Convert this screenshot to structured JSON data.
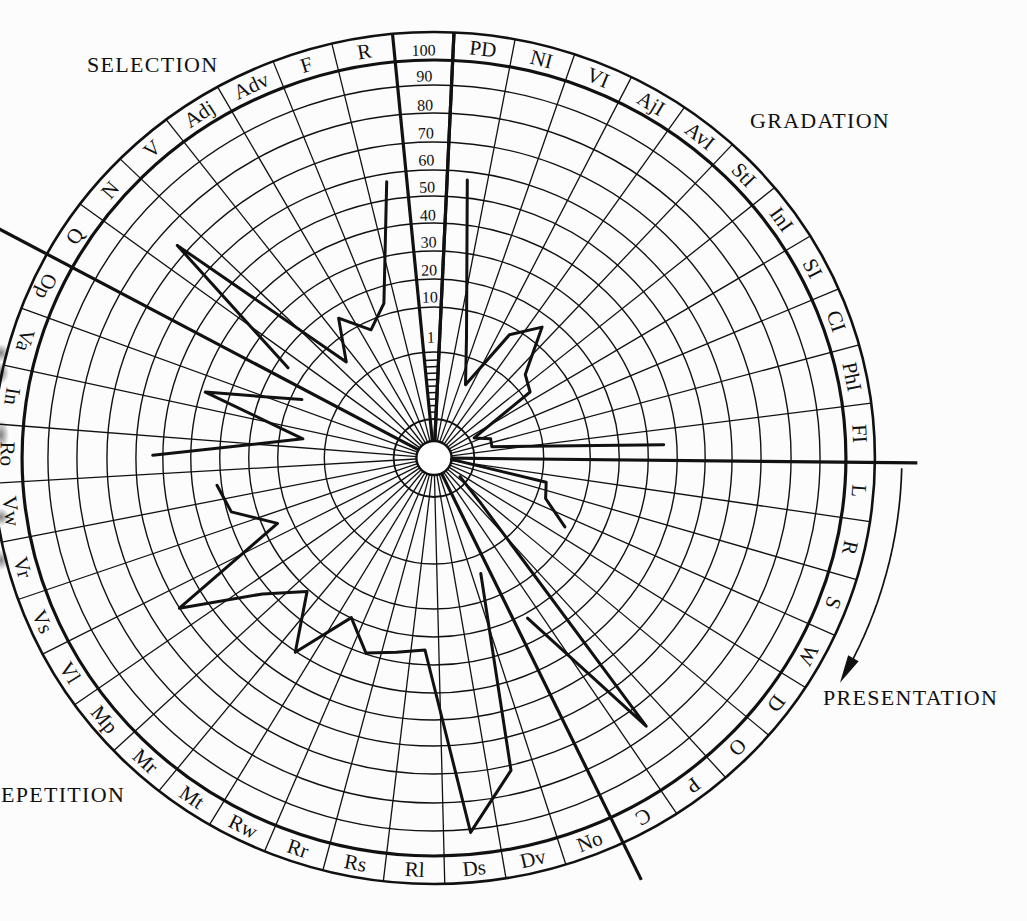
{
  "page": {
    "background": "#fcfcfc",
    "ink": "#111111"
  },
  "chart_data": {
    "type": "line",
    "coordinate_system": "polar",
    "title": "",
    "radial_axis": {
      "labels": [
        "100",
        "90",
        "80",
        "70",
        "60",
        "50",
        "40",
        "30",
        "20",
        "10",
        "1"
      ],
      "ticks": [
        100,
        90,
        80,
        70,
        60,
        50,
        40,
        30,
        20,
        10,
        1
      ],
      "range": [
        0,
        100
      ],
      "grid": true
    },
    "sections": [
      {
        "name": "GRADATION",
        "categories": [
          "PD",
          "NI",
          "VI",
          "AjI",
          "AvI",
          "StI",
          "InI",
          "SI",
          "CI",
          "PhI",
          "FI"
        ]
      },
      {
        "name": "PRESENTATION",
        "categories": [
          "L",
          "R",
          "S",
          "W",
          "D",
          "O",
          "P",
          "C"
        ]
      },
      {
        "name": "REPETITION",
        "categories": [
          "No",
          "Dv",
          "Ds",
          "Rl",
          "Rs",
          "Rr",
          "Rw",
          "Mt",
          "Mr",
          "Mp",
          "Vl",
          "Vs",
          "Vr",
          "Vw",
          "Ro",
          "In",
          "Va",
          "Op"
        ]
      },
      {
        "name": "SELECTION",
        "categories": [
          "Q",
          "N",
          "V",
          "Adj",
          "Adv",
          "F",
          "R"
        ]
      }
    ],
    "series": [
      {
        "name": "GRADATION",
        "segments": [
          [
            [
              "PD",
              57
            ],
            [
              "NI",
              2.6
            ],
            [
              "VI",
              0.7
            ],
            [
              "AjI",
              6.7
            ],
            [
              "AvI",
              16
            ],
            [
              "StI",
              2.2
            ],
            [
              "InI",
              1.5
            ],
            [
              "SI",
              0.3
            ],
            [
              "CI",
              0.46
            ],
            [
              "PhI",
              0.45
            ],
            [
              "FI",
              36
            ]
          ]
        ]
      },
      {
        "name": "PRESENTATION",
        "segments": [
          [
            [
              "L",
              0
            ],
            [
              "R",
              1.3
            ],
            [
              "S",
              1.6
            ],
            [
              "W",
              7
            ]
          ],
          [
            [
              "D",
              0.16
            ],
            [
              "O",
              0.5
            ],
            [
              "P",
              78
            ],
            [
              "C",
              22
            ]
          ]
        ]
      },
      {
        "name": "REPETITION",
        "segments": [
          [
            [
              "No",
              2.5
            ],
            [
              "Dv",
              72
            ],
            [
              "Ds",
              92
            ],
            [
              "Rl",
              25
            ],
            [
              "Rs",
              27
            ],
            [
              "Rr",
              30
            ],
            [
              "Rw",
              20
            ],
            [
              "Mt",
              41
            ],
            [
              "Mr",
              21
            ],
            [
              "Mp",
              33
            ],
            [
              "Vl",
              60
            ],
            [
              "Vs",
              15
            ],
            [
              "Vr",
              29
            ],
            [
              "Vw",
              32
            ]
          ],
          [
            [
              "Ro",
              54
            ],
            [
              "In",
              3.1
            ],
            [
              "Va",
              39
            ],
            [
              "Op",
              5.8
            ]
          ]
        ]
      },
      {
        "name": "SELECTION",
        "segments": [
          [
            [
              "Q",
              16
            ],
            [
              "N",
              74
            ],
            [
              "V",
              3.1
            ],
            [
              "Adj",
              16
            ],
            [
              "Adv",
              6.3
            ],
            [
              "F",
              14
            ],
            [
              "R",
              57
            ]
          ]
        ]
      }
    ],
    "annotations": [
      {
        "type": "curved-arrow",
        "direction": "clockwise",
        "near": "PRESENTATION"
      }
    ],
    "legend": null
  }
}
